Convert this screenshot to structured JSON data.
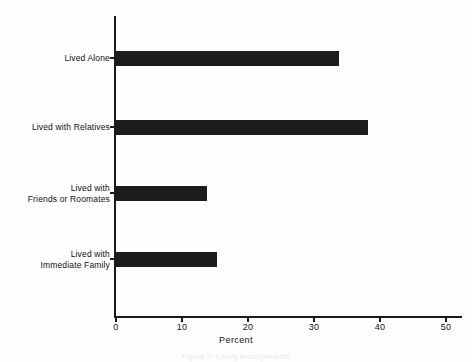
{
  "chart_data": {
    "type": "bar",
    "orientation": "horizontal",
    "title": "",
    "categories": [
      "Lived Alone",
      "Lived with Relatives",
      "Lived with\nFriends or Roomates",
      "Lived with\nImmediate Family"
    ],
    "values": [
      33.8,
      38.2,
      13.8,
      15.3
    ],
    "xlabel": "Percent",
    "ylabel": "",
    "xlim": [
      0,
      50
    ],
    "xticks": [
      0,
      10,
      20,
      30,
      40,
      50
    ],
    "xtick_labels": [
      "0",
      "10",
      "20",
      "30",
      "40",
      "50"
    ],
    "grid": false,
    "legend": false,
    "bar_color": "#1c1c1c",
    "axis_color": "#1a1a1a",
    "background": "#fefefe"
  },
  "caption": "Figure 3.  Living Arrangements"
}
